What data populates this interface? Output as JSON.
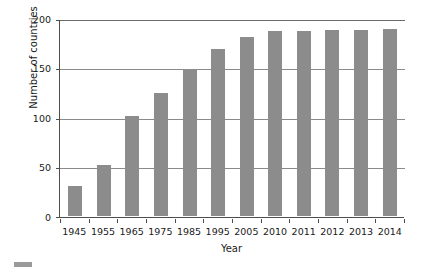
{
  "chart_data": {
    "type": "bar",
    "title": "",
    "subtitle": "",
    "xlabel": "Year",
    "ylabel": "Number of countries",
    "categories": [
      "1945",
      "1955",
      "1965",
      "1975",
      "1985",
      "1995",
      "2005",
      "2010",
      "2011",
      "2012",
      "2013",
      "2014"
    ],
    "values": [
      30,
      52,
      101,
      124,
      149,
      169,
      181,
      187,
      187,
      188,
      188,
      189
    ],
    "series": [
      {
        "name": "Number of countries",
        "values": [
          30,
          52,
          101,
          124,
          149,
          169,
          181,
          187,
          187,
          188,
          188,
          189
        ]
      }
    ],
    "ylim": [
      0,
      200
    ],
    "yticks": [
      "0",
      "50",
      "100",
      "150",
      "200"
    ],
    "ytick_values": [
      0,
      50,
      100,
      150,
      200
    ],
    "grid": "horizontal",
    "legend_position": "none",
    "bar_color": "#8c8c8c",
    "axis_color": "#4d4d4d",
    "gridline_color": "#8a8a8a",
    "background_color": "#ffffff"
  },
  "legend": {
    "swatch_color": "#9a9a9a",
    "label": ""
  }
}
